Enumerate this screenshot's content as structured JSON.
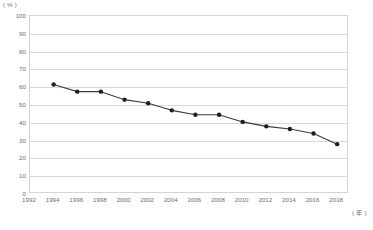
{
  "chart_data": {
    "type": "line",
    "title": "",
    "subtitle": "",
    "xlabel": "( 年 )",
    "ylabel": "( % )",
    "x": [
      1994,
      1996,
      1998,
      2000,
      2002,
      2004,
      2006,
      2008,
      2010,
      2012,
      2014,
      2016,
      2018
    ],
    "values": [
      61.5,
      57.5,
      57.5,
      53,
      51,
      47,
      44.5,
      44.5,
      40.5,
      38,
      36.5,
      34,
      28
    ],
    "series": [
      {
        "name": "",
        "values": [
          61.5,
          57.5,
          57.5,
          53,
          51,
          47,
          44.5,
          44.5,
          40.5,
          38,
          36.5,
          34,
          28
        ]
      }
    ],
    "categories": [
      "1994",
      "1996",
      "1998",
      "2000",
      "2002",
      "2004",
      "2006",
      "2008",
      "2010",
      "2012",
      "2014",
      "2016",
      "2018"
    ],
    "x_tick_labels": [
      "1992",
      "1994",
      "1996",
      "1998",
      "2000",
      "2002",
      "2004",
      "2006",
      "2008",
      "2010",
      "2012",
      "2014",
      "2016",
      "2018"
    ],
    "y_tick_labels": [
      "100",
      "90",
      "80",
      "70",
      "60",
      "50",
      "40",
      "30",
      "20",
      "10",
      "0"
    ],
    "y_ticks": [
      100,
      90,
      80,
      70,
      60,
      50,
      40,
      30,
      20,
      10,
      0
    ],
    "xlim": [
      1992,
      2019
    ],
    "ylim": [
      0,
      100
    ],
    "grid": true,
    "grid_axis": "y",
    "legend": false,
    "legend_position": "none",
    "line_color": "#3a3a3a",
    "marker_color": "#1f1f1f",
    "grid_color": "#d9d9d9",
    "axis_color": "#d4d4d4",
    "tick_label_color": "#6d6d6d",
    "background_color": "#ffffff"
  }
}
